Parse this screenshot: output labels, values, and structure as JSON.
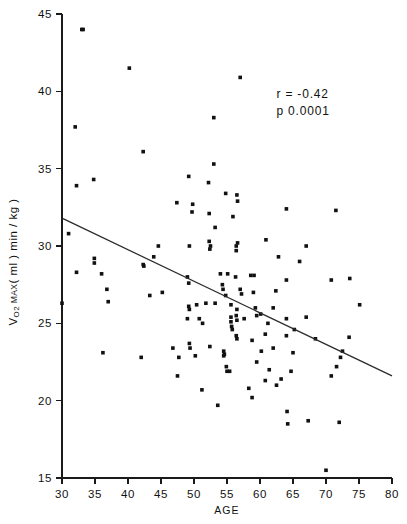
{
  "chart_data": {
    "type": "scatter",
    "title": "",
    "xlabel": "AGE",
    "ylabel": "V O2 MAX ( ml ) min / kg )",
    "ylabel_parts": {
      "lead": "V",
      "sub": "O2",
      "smallcap": " MAX",
      "rest": "( ml ) min / kg )"
    },
    "xlim": [
      30,
      80
    ],
    "ylim": [
      15,
      45
    ],
    "xticks": [
      30,
      35,
      40,
      45,
      50,
      55,
      60,
      65,
      70,
      75,
      80
    ],
    "yticks": [
      15,
      20,
      25,
      30,
      35,
      40,
      45
    ],
    "xtick_labels": [
      "30",
      "35",
      "40",
      "45",
      "50",
      "55",
      "60",
      "65",
      "70",
      "75",
      "80"
    ],
    "ytick_labels": [
      "15",
      "20",
      "25",
      "30",
      "35",
      "40",
      "45"
    ],
    "grid": false,
    "legend": null,
    "marker": "filled-square-dot",
    "marker_color": "#111111",
    "annotations": [
      {
        "name": "correlation",
        "text": "r = -0.42",
        "x": 62.5,
        "y": 39.6
      },
      {
        "name": "pvalue",
        "text": "p  0.0001",
        "x": 62.5,
        "y": 38.5
      }
    ],
    "fit_line": {
      "name": "regression-line",
      "x": [
        30,
        80
      ],
      "y": [
        31.8,
        21.6
      ],
      "slope": -0.204,
      "intercept": 37.92,
      "color": "#2b2b2b"
    },
    "points": [
      [
        33.2,
        44.0
      ],
      [
        32.0,
        37.7
      ],
      [
        40.2,
        41.5
      ],
      [
        57.0,
        40.9
      ],
      [
        42.3,
        36.1
      ],
      [
        53.0,
        38.3
      ],
      [
        53.0,
        35.3
      ],
      [
        49.2,
        34.5
      ],
      [
        52.2,
        34.1
      ],
      [
        34.8,
        34.3
      ],
      [
        32.2,
        33.9
      ],
      [
        54.8,
        33.4
      ],
      [
        56.5,
        33.3
      ],
      [
        56.6,
        32.9
      ],
      [
        47.4,
        32.8
      ],
      [
        49.8,
        32.7
      ],
      [
        49.7,
        32.2
      ],
      [
        52.3,
        32.1
      ],
      [
        64.0,
        32.4
      ],
      [
        71.5,
        32.3
      ],
      [
        55.9,
        31.9
      ],
      [
        53.2,
        31.2
      ],
      [
        31.0,
        30.8
      ],
      [
        44.6,
        30.0
      ],
      [
        49.3,
        30.0
      ],
      [
        52.3,
        30.3
      ],
      [
        52.5,
        30.0
      ],
      [
        52.4,
        29.8
      ],
      [
        56.4,
        30.0
      ],
      [
        56.4,
        29.7
      ],
      [
        56.6,
        30.2
      ],
      [
        60.9,
        30.4
      ],
      [
        67.0,
        30.0
      ],
      [
        34.9,
        29.2
      ],
      [
        34.9,
        28.9
      ],
      [
        43.9,
        29.3
      ],
      [
        42.3,
        28.8
      ],
      [
        42.4,
        28.7
      ],
      [
        62.8,
        29.3
      ],
      [
        66.0,
        29.0
      ],
      [
        32.2,
        28.3
      ],
      [
        36.0,
        28.2
      ],
      [
        49.0,
        28.0
      ],
      [
        54.0,
        28.2
      ],
      [
        55.1,
        28.2
      ],
      [
        58.6,
        28.1
      ],
      [
        59.1,
        28.1
      ],
      [
        64.0,
        27.8
      ],
      [
        70.8,
        27.8
      ],
      [
        73.6,
        27.9
      ],
      [
        49.2,
        27.6
      ],
      [
        54.3,
        27.5
      ],
      [
        54.4,
        27.2
      ],
      [
        36.8,
        27.2
      ],
      [
        45.2,
        27.0
      ],
      [
        54.8,
        26.8
      ],
      [
        57.0,
        27.2
      ],
      [
        57.2,
        26.9
      ],
      [
        59.0,
        27.0
      ],
      [
        62.4,
        27.1
      ],
      [
        30.0,
        26.3
      ],
      [
        37.0,
        26.4
      ],
      [
        43.3,
        26.8
      ],
      [
        49.2,
        26.1
      ],
      [
        49.3,
        25.9
      ],
      [
        50.4,
        26.2
      ],
      [
        51.8,
        26.3
      ],
      [
        53.2,
        26.3
      ],
      [
        55.6,
        26.2
      ],
      [
        56.5,
        25.9
      ],
      [
        59.3,
        26.0
      ],
      [
        62.0,
        26.0
      ],
      [
        75.1,
        26.2
      ],
      [
        49.0,
        25.3
      ],
      [
        50.8,
        25.3
      ],
      [
        51.3,
        25.0
      ],
      [
        55.6,
        25.4
      ],
      [
        55.6,
        25.1
      ],
      [
        55.7,
        24.8
      ],
      [
        56.4,
        25.5
      ],
      [
        56.5,
        25.2
      ],
      [
        57.6,
        25.3
      ],
      [
        59.5,
        25.5
      ],
      [
        60.1,
        25.6
      ],
      [
        64.0,
        25.3
      ],
      [
        67.0,
        25.4
      ],
      [
        55.8,
        24.6
      ],
      [
        56.4,
        24.2
      ],
      [
        56.5,
        24.0
      ],
      [
        58.8,
        23.9
      ],
      [
        60.8,
        24.3
      ],
      [
        64.0,
        24.2
      ],
      [
        65.2,
        24.6
      ],
      [
        68.4,
        24.0
      ],
      [
        73.5,
        24.1
      ],
      [
        46.8,
        23.4
      ],
      [
        49.3,
        23.7
      ],
      [
        49.4,
        23.4
      ],
      [
        52.4,
        23.5
      ],
      [
        54.5,
        23.2
      ],
      [
        54.5,
        22.9
      ],
      [
        54.6,
        23.0
      ],
      [
        50.2,
        22.9
      ],
      [
        60.2,
        23.2
      ],
      [
        62.0,
        23.4
      ],
      [
        65.0,
        23.1
      ],
      [
        72.5,
        23.2
      ],
      [
        36.2,
        23.1
      ],
      [
        42.0,
        22.8
      ],
      [
        47.7,
        22.8
      ],
      [
        59.5,
        22.5
      ],
      [
        54.9,
        22.2
      ],
      [
        55.0,
        21.9
      ],
      [
        61.4,
        22.0
      ],
      [
        64.7,
        21.9
      ],
      [
        70.8,
        21.6
      ],
      [
        71.6,
        22.2
      ],
      [
        72.2,
        22.8
      ],
      [
        47.5,
        21.6
      ],
      [
        51.2,
        20.7
      ],
      [
        58.3,
        20.8
      ],
      [
        60.8,
        21.3
      ],
      [
        62.5,
        21.0
      ],
      [
        63.2,
        21.4
      ],
      [
        58.8,
        20.2
      ],
      [
        53.6,
        19.7
      ],
      [
        64.1,
        19.3
      ],
      [
        64.2,
        18.5
      ],
      [
        67.3,
        18.7
      ],
      [
        72.0,
        18.6
      ],
      [
        70.0,
        15.5
      ],
      [
        33.0,
        44.0
      ],
      [
        56.3,
        28.0
      ],
      [
        61.2,
        25.0
      ],
      [
        55.4,
        21.9
      ]
    ],
    "n_points": 135
  },
  "figure": {
    "background": "#ffffff",
    "foreground": "#111111"
  }
}
